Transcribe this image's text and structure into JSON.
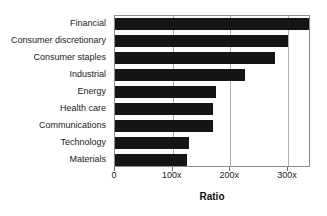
{
  "chart_data": {
    "type": "bar",
    "orientation": "horizontal",
    "title": "",
    "xlabel": "Ratio",
    "ylabel": "",
    "categories": [
      "Financial",
      "Consumer discretionary",
      "Consumer staples",
      "Industrial",
      "Energy",
      "Health care",
      "Communications",
      "Technology",
      "Materials"
    ],
    "values": [
      337,
      300,
      277,
      226,
      175,
      170,
      170,
      128,
      125
    ],
    "xlim": [
      0,
      340
    ],
    "xticks": [
      0,
      100,
      200,
      300
    ],
    "xticklabels": [
      "0",
      "100x",
      "200x",
      "300x"
    ],
    "grid": true,
    "legend": false,
    "bar_color": "#151515",
    "frame_color": "#8c8c8c",
    "gridline_color": "#aeaeae",
    "background": "#ffffff"
  },
  "axis": {
    "x_title": "Ratio"
  }
}
